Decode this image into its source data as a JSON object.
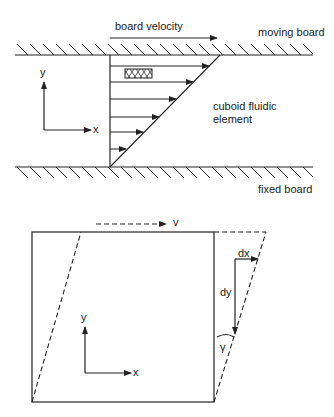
{
  "top_diagram": {
    "velocity_label": "board velocity",
    "moving_board_label": "moving board",
    "fixed_board_label": "fixed board",
    "element_label_line1": "cuboid fluidic",
    "element_label_line2": "element",
    "axis_y": "y",
    "axis_x": "x",
    "velocity_profile_arrow_count": 6
  },
  "bottom_diagram": {
    "velocity_label": "v",
    "dx_label": "dx",
    "dy_label": "dy",
    "shear_angle_label": "γ",
    "axis_y": "y",
    "axis_x": "x"
  },
  "colors": {
    "line": "#222222",
    "background": "#ffffff"
  }
}
